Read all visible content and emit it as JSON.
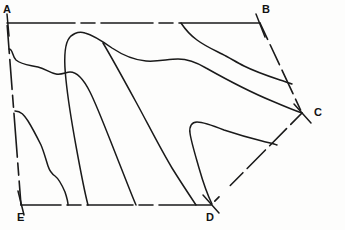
{
  "figure": {
    "background_color": "#fdfdfc",
    "stroke_color": "#1a1a1a",
    "label_color": "#121212",
    "width": 345,
    "height": 230,
    "vertices": [
      {
        "id": "A",
        "label": "A",
        "x": 7,
        "y": 23,
        "label_x": 3,
        "label_y": 4
      },
      {
        "id": "B",
        "label": "B",
        "x": 260,
        "y": 23,
        "label_x": 262,
        "label_y": 4
      },
      {
        "id": "C",
        "label": "C",
        "x": 302,
        "y": 113,
        "label_x": 313,
        "label_y": 107
      },
      {
        "id": "D",
        "label": "D",
        "x": 211,
        "y": 205,
        "label_x": 206,
        "label_y": 211
      },
      {
        "id": "E",
        "label": "E",
        "x": 21,
        "y": 205,
        "label_x": 17,
        "label_y": 211
      }
    ],
    "boundary_edges": [
      {
        "id": "A-B",
        "from": "A",
        "to": "B",
        "style": "dash-dot-solid"
      },
      {
        "id": "B-C",
        "from": "B",
        "to": "C",
        "style": "dashed"
      },
      {
        "id": "C-D",
        "from": "C",
        "to": "D",
        "style": "dashed"
      },
      {
        "id": "D-E",
        "from": "D",
        "to": "E",
        "style": "dash-dot-solid"
      },
      {
        "id": "E-A",
        "from": "E",
        "to": "A",
        "style": "dashed"
      }
    ],
    "vertex_ticks": [
      {
        "id": "tick-A",
        "x1": 7,
        "y1": 14,
        "x2": 9,
        "y2": 36
      },
      {
        "id": "tick-B",
        "x1": 256,
        "y1": 14,
        "x2": 264,
        "y2": 36
      },
      {
        "id": "tick-C",
        "x1": 295,
        "y1": 104,
        "x2": 310,
        "y2": 122
      },
      {
        "id": "tick-D",
        "x1": 204,
        "y1": 196,
        "x2": 218,
        "y2": 213
      },
      {
        "id": "tick-E",
        "x1": 18,
        "y1": 192,
        "x2": 23,
        "y2": 214
      }
    ],
    "contours": [
      {
        "id": "contour-upper-left-band",
        "name": "upper-left-band"
      },
      {
        "id": "contour-lower-left-band",
        "name": "lower-left-band"
      },
      {
        "id": "contour-central-tongue",
        "name": "central-tongue"
      },
      {
        "id": "contour-upper-right-band",
        "name": "upper-right-band"
      },
      {
        "id": "contour-lower-right-lobe",
        "name": "lower-right-lobe"
      },
      {
        "id": "contour-mid-descender",
        "name": "mid-descender"
      }
    ]
  }
}
